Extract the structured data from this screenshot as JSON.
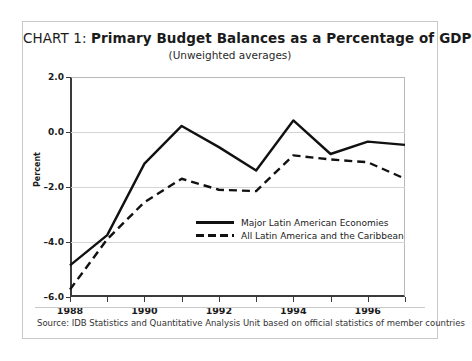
{
  "title": {
    "prefix": "CHART 1: ",
    "main": "Primary Budget Balances as a Percentage of GDP",
    "subtitle": "(Unweighted averages)"
  },
  "source": {
    "text": "Source: IDB Statistics and Quantitative Analysis Unit based on official statistics of member countries"
  },
  "chart_data": {
    "type": "line",
    "title": "CHART 1: Primary Budget Balances as a Percentage of GDP",
    "subtitle": "(Unweighted averages)",
    "xlabel": "",
    "ylabel": "Percent",
    "x": [
      1988,
      1989,
      1990,
      1991,
      1992,
      1993,
      1994,
      1995,
      1996,
      1997
    ],
    "xlim": [
      1988,
      1997
    ],
    "ylim": [
      -6.0,
      2.0
    ],
    "xticks": [
      1988,
      1990,
      1992,
      1994,
      1996
    ],
    "xtick_labels": [
      "1988",
      "1990",
      "1992",
      "1994",
      "1996"
    ],
    "xticks_minor": [
      1989,
      1991,
      1993,
      1995,
      1997
    ],
    "yticks": [
      2.0,
      0.0,
      -2.0,
      -4.0,
      -6.0
    ],
    "ytick_labels": [
      "2.0",
      "0.0",
      "-2.0",
      "-4.0",
      "-6.0"
    ],
    "grid": "horizontal",
    "legend_position": "inside-lower-center",
    "series": [
      {
        "name": "Major Latin American Economies",
        "style": "solid",
        "color": "#111111",
        "values": [
          -4.85,
          -3.75,
          -1.15,
          0.22,
          -0.55,
          -1.4,
          0.42,
          -0.8,
          -0.35,
          -0.47
        ]
      },
      {
        "name": "All Latin America and the Caribbean",
        "style": "dashed",
        "color": "#111111",
        "values": [
          -5.73,
          -3.9,
          -2.55,
          -1.7,
          -2.1,
          -2.15,
          -0.85,
          -1.0,
          -1.1,
          -1.7
        ]
      }
    ]
  },
  "legend": {
    "items": [
      {
        "label": "Major Latin American Economies",
        "style": "solid"
      },
      {
        "label": "All Latin America and the Caribbean",
        "style": "dashed"
      }
    ]
  },
  "colors": {
    "line": "#111111",
    "grid": "#d5d5d5",
    "axis": "#3a3a3a",
    "border": "#c9c9c9",
    "text": "#1b1b1b"
  }
}
